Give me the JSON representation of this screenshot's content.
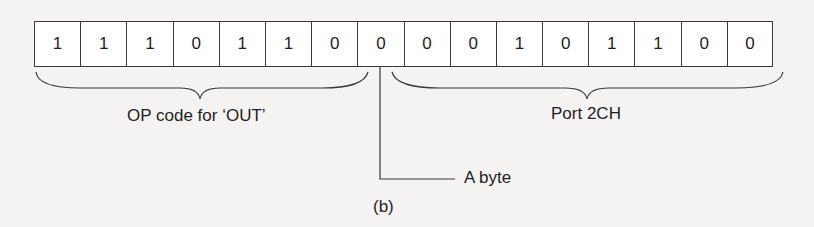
{
  "figure": {
    "bits": [
      "1",
      "1",
      "1",
      "0",
      "1",
      "1",
      "0",
      "0",
      "0",
      "0",
      "1",
      "0",
      "1",
      "1",
      "0",
      "0"
    ],
    "groups": [
      {
        "label": "OP code for ‘OUT’",
        "bit_range": [
          0,
          7
        ]
      },
      {
        "label": "Port 2CH",
        "bit_range": [
          8,
          15
        ]
      }
    ],
    "pointer_label": "A byte",
    "caption": "(b)"
  }
}
